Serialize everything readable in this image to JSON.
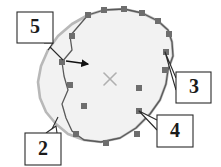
{
  "figure": {
    "background_color": "#ffffff",
    "width": 221,
    "height": 167
  },
  "shape": {
    "name": "region-outline",
    "fill_color": "#f2f2f2",
    "outer_contour_color": "#b8b8b8",
    "outer_contour_width": 2.6,
    "inner_path_color": "#5a5a5a",
    "inner_path_width": 1.3,
    "vertex_marker_color": "#6e6e6e",
    "vertex_marker_size": 6,
    "outer_contour_points": "104,10 124,9 142,13 158,21 168,30 172,42 173,56 168,70 166,84 160,100 150,114 136,128 120,138 101,142 84,140 68,134 56,124 46,112 40,98 38,82 41,66 48,50 58,36 72,24 88,15",
    "inner_path_points": "104,10 124,9 142,13 158,21 168,30 172,42 173,56 168,70 166,84 160,100 150,114 136,128 120,138 101,142 84,140 72,131 66,118 62,104 68,90 64,76 62,62 72,50 70,36 82,22 88,15",
    "vertices": [
      {
        "x": 88,
        "y": 15,
        "name": "vertex-upper-left"
      },
      {
        "x": 104,
        "y": 10,
        "name": "vertex-top-left-mid"
      },
      {
        "x": 124,
        "y": 9,
        "name": "vertex-top-right-mid"
      },
      {
        "x": 142,
        "y": 13,
        "name": "vertex-top-right"
      },
      {
        "x": 158,
        "y": 21,
        "name": "vertex-right-upper"
      },
      {
        "x": 169,
        "y": 34,
        "name": "vertex-right-shoulder"
      },
      {
        "x": 166,
        "y": 52,
        "name": "vertex-right-upper-mid"
      },
      {
        "x": 165,
        "y": 70,
        "name": "vertex-right-mid"
      },
      {
        "x": 139,
        "y": 88,
        "name": "vertex-interior-right-upper"
      },
      {
        "x": 139,
        "y": 111,
        "name": "vertex-interior-right-lower"
      },
      {
        "x": 137,
        "y": 134,
        "name": "vertex-bottom-right"
      },
      {
        "x": 106,
        "y": 143,
        "name": "vertex-bottom-mid"
      },
      {
        "x": 76,
        "y": 134,
        "name": "vertex-bottom-left"
      },
      {
        "x": 84,
        "y": 106,
        "name": "vertex-left-lower"
      },
      {
        "x": 70,
        "y": 85,
        "name": "vertex-left-mid"
      },
      {
        "x": 62,
        "y": 62,
        "name": "vertex-left-upper"
      },
      {
        "x": 72,
        "y": 36,
        "name": "vertex-upper-left-mid"
      }
    ]
  },
  "center_mark": {
    "name": "center-cross-mark",
    "x": 110,
    "y": 79,
    "size": 6,
    "color": "#b0b0b0",
    "stroke_width": 1.6
  },
  "arrow": {
    "name": "direction-arrow",
    "from_x": 66,
    "from_y": 61,
    "to_x": 88,
    "to_y": 64,
    "color": "#111111",
    "stroke_width": 1.6
  },
  "callouts": [
    {
      "id": "callout-5",
      "label": "5",
      "box": {
        "x": 17,
        "y": 12,
        "width": 36,
        "height": 31
      },
      "text_x": 35,
      "text_y": 28,
      "tail": "44,43 53,43 48,50",
      "leader": "50,47 63,60"
    },
    {
      "id": "callout-2",
      "label": "2",
      "box": {
        "x": 25,
        "y": 133,
        "width": 36,
        "height": 32
      },
      "text_x": 43,
      "text_y": 150,
      "tail": "46,133 56,126 57,133",
      "leader": "52,129 58,117"
    },
    {
      "id": "callout-3",
      "label": "3",
      "box": {
        "x": 176,
        "y": 72,
        "width": 35,
        "height": 31
      },
      "text_x": 194,
      "text_y": 88,
      "tail": "176,78 165,52 176,90",
      "leader": ""
    },
    {
      "id": "callout-4",
      "label": "4",
      "box": {
        "x": 157,
        "y": 115,
        "width": 36,
        "height": 32
      },
      "text_x": 175,
      "text_y": 132,
      "tail": "157,120 139,111 157,130",
      "leader": ""
    }
  ],
  "style": {
    "box_border_color": "#2a2a2a",
    "box_border_width": 1.1,
    "box_fill_color": "#ffffff",
    "leader_color": "#2a2a2a",
    "leader_width": 1.1
  }
}
